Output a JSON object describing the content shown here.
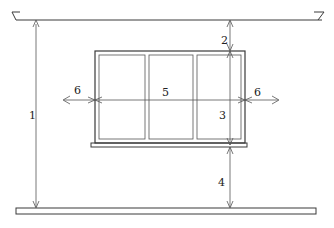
{
  "diagram": {
    "title": "",
    "elements": {
      "ceiling": "ceiling-line",
      "floor": "floor-slab",
      "window": {
        "panes": 3,
        "has_sill": true
      }
    },
    "dimension_labels": {
      "ceiling_to_floor": "1",
      "ceiling_to_window_top": "2",
      "window_height": "3",
      "sill_to_floor": "4",
      "window_width": "5",
      "side_clearance_left": "6",
      "side_clearance_right": "6"
    }
  }
}
